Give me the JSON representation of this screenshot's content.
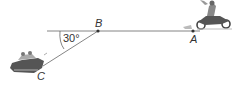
{
  "diagram": {
    "points": {
      "A": {
        "label": "A",
        "x": 193,
        "y": 31
      },
      "B": {
        "label": "B",
        "x": 98,
        "y": 31
      },
      "C": {
        "label": "C",
        "x": 42,
        "y": 69
      }
    },
    "angle": {
      "label": "30°",
      "vertex": "C-side",
      "between": [
        "horizontal line",
        "BC"
      ]
    },
    "icons": {
      "motorcycle": "motorcycle-rider-icon",
      "car": "car-icon"
    },
    "colors": {
      "line": "#555555",
      "text": "#333333"
    }
  }
}
